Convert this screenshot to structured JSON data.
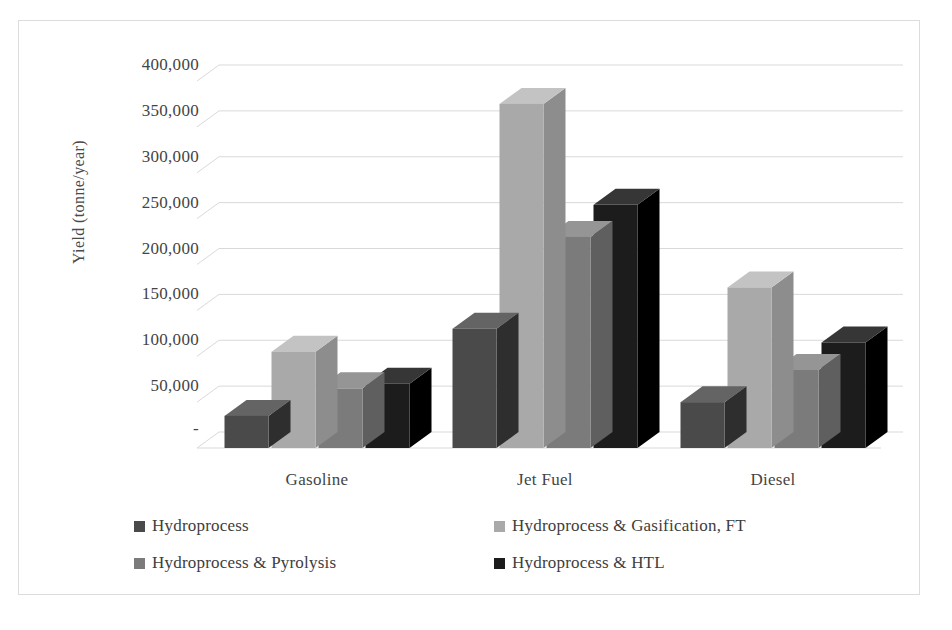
{
  "chart_data": {
    "type": "bar",
    "title": "",
    "subtitle": "",
    "xlabel": "",
    "ylabel": "Yield (tonne/year)",
    "categories": [
      "Gasoline",
      "Jet Fuel",
      "Diesel"
    ],
    "series": [
      {
        "name": "Hydroprocess",
        "color": "#4a4a4a",
        "values": [
          35000,
          130000,
          50000
        ]
      },
      {
        "name": "Hydroprocess & Gasification, FT",
        "color": "#a9a9a9",
        "values": [
          105000,
          375000,
          175000
        ]
      },
      {
        "name": "Hydroprocess & Pyrolysis",
        "color": "#7b7b7b",
        "values": [
          65000,
          230000,
          85000
        ]
      },
      {
        "name": "Hydroprocess & HTL",
        "color": "#1c1c1c",
        "values": [
          70000,
          265000,
          115000
        ]
      }
    ],
    "ylim": [
      0,
      400000
    ],
    "y_ticks": [
      0,
      50000,
      100000,
      150000,
      200000,
      250000,
      300000,
      350000,
      400000
    ],
    "y_tick_labels": [
      "-",
      "50,000",
      "100,000",
      "150,000",
      "200,000",
      "250,000",
      "300,000",
      "350,000",
      "400,000"
    ],
    "grid": true,
    "grid_axis": "y",
    "legend_position": "bottom",
    "style": "3d-clustered-column",
    "plot_background": "#ffffff",
    "grid_color": "#d9d9d9",
    "frame_color": "#dcdcdc"
  },
  "legend": {
    "items": [
      {
        "label": "Hydroprocess",
        "color": "#4a4a4a"
      },
      {
        "label": "Hydroprocess & Gasification, FT",
        "color": "#a9a9a9"
      },
      {
        "label": "Hydroprocess & Pyrolysis",
        "color": "#7b7b7b"
      },
      {
        "label": "Hydroprocess & HTL",
        "color": "#1c1c1c"
      }
    ]
  },
  "axes": {
    "y_title": "Yield (tonne/year)",
    "y_tick_labels": [
      "400,000",
      "350,000",
      "300,000",
      "250,000",
      "200,000",
      "150,000",
      "100,000",
      "50,000",
      "-"
    ],
    "x_tick_labels": [
      "Gasoline",
      "Jet Fuel",
      "Diesel"
    ]
  }
}
